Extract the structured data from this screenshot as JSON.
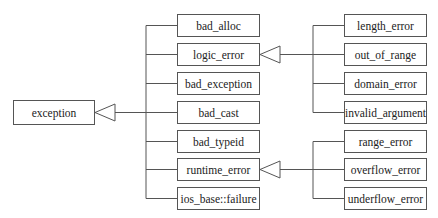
{
  "diagram": {
    "type": "class-hierarchy",
    "root": {
      "id": "exception",
      "label": "exception",
      "x": 13,
      "y": 100,
      "w": 82,
      "h": 25
    },
    "middle": [
      {
        "id": "bad_alloc",
        "label": "bad_alloc",
        "x": 177,
        "y": 14,
        "w": 83,
        "h": 23
      },
      {
        "id": "logic_error",
        "label": "logic_error",
        "x": 177,
        "y": 43,
        "w": 83,
        "h": 23
      },
      {
        "id": "bad_exception",
        "label": "bad_exception",
        "x": 177,
        "y": 72,
        "w": 83,
        "h": 23
      },
      {
        "id": "bad_cast",
        "label": "bad_cast",
        "x": 177,
        "y": 101,
        "w": 83,
        "h": 23
      },
      {
        "id": "bad_typeid",
        "label": "bad_typeid",
        "x": 177,
        "y": 130,
        "w": 83,
        "h": 23
      },
      {
        "id": "runtime_error",
        "label": "runtime_error",
        "x": 177,
        "y": 158,
        "w": 83,
        "h": 23
      },
      {
        "id": "ios_base_failure",
        "label": "ios_base::failure",
        "x": 177,
        "y": 187,
        "w": 83,
        "h": 23
      }
    ],
    "logic_children": [
      {
        "id": "length_error",
        "label": "length_error",
        "x": 344,
        "y": 14,
        "w": 83,
        "h": 23
      },
      {
        "id": "out_of_range",
        "label": "out_of_range",
        "x": 344,
        "y": 43,
        "w": 83,
        "h": 23
      },
      {
        "id": "domain_error",
        "label": "domain_error",
        "x": 344,
        "y": 72,
        "w": 83,
        "h": 23
      },
      {
        "id": "invalid_argument",
        "label": "invalid_argument",
        "x": 344,
        "y": 101,
        "w": 83,
        "h": 23
      }
    ],
    "runtime_children": [
      {
        "id": "range_error",
        "label": "range_error",
        "x": 344,
        "y": 130,
        "w": 83,
        "h": 23
      },
      {
        "id": "overflow_error",
        "label": "overflow_error",
        "x": 344,
        "y": 158,
        "w": 83,
        "h": 23
      },
      {
        "id": "underflow_error",
        "label": "underflow_error",
        "x": 344,
        "y": 187,
        "w": 83,
        "h": 23
      }
    ],
    "relations": [
      {
        "from": "bad_alloc",
        "to": "exception",
        "kind": "inheritance"
      },
      {
        "from": "logic_error",
        "to": "exception",
        "kind": "inheritance"
      },
      {
        "from": "bad_exception",
        "to": "exception",
        "kind": "inheritance"
      },
      {
        "from": "bad_cast",
        "to": "exception",
        "kind": "inheritance"
      },
      {
        "from": "bad_typeid",
        "to": "exception",
        "kind": "inheritance"
      },
      {
        "from": "runtime_error",
        "to": "exception",
        "kind": "inheritance"
      },
      {
        "from": "ios_base_failure",
        "to": "exception",
        "kind": "inheritance"
      },
      {
        "from": "length_error",
        "to": "logic_error",
        "kind": "inheritance"
      },
      {
        "from": "out_of_range",
        "to": "logic_error",
        "kind": "inheritance"
      },
      {
        "from": "domain_error",
        "to": "logic_error",
        "kind": "inheritance"
      },
      {
        "from": "invalid_argument",
        "to": "logic_error",
        "kind": "inheritance"
      },
      {
        "from": "range_error",
        "to": "runtime_error",
        "kind": "inheritance"
      },
      {
        "from": "overflow_error",
        "to": "runtime_error",
        "kind": "inheritance"
      },
      {
        "from": "underflow_error",
        "to": "runtime_error",
        "kind": "inheritance"
      }
    ],
    "colors": {
      "line": "#555555",
      "text": "#222222",
      "background": "#ffffff"
    }
  }
}
